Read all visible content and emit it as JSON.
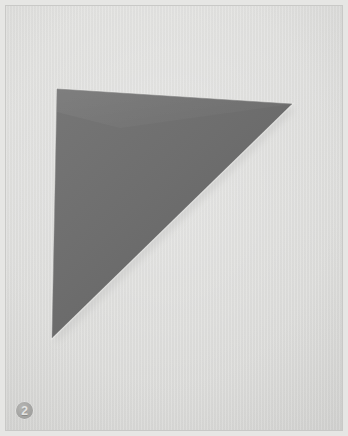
{
  "figure": {
    "number_label": "2",
    "caption": "",
    "badge_icon_name": "circled-number-badge"
  },
  "plate": {
    "width": 348,
    "height": 436,
    "background_color": "#dcdcda",
    "frame_color": "#c9c9c7",
    "margin_color": "#e6e6e4"
  },
  "artwork": {
    "title": "",
    "medium_note": "",
    "shape_name": "triangle",
    "shape_color": "#6e6e6e",
    "shape_color_light": "#787878",
    "shape_color_dark": "#646464",
    "edge_highlight_color": "#e9e9e7",
    "shadow_color": "#c8c8c6",
    "vertices": [
      {
        "name": "top-left",
        "x": 57,
        "y": 89
      },
      {
        "name": "top-right",
        "x": 292,
        "y": 104
      },
      {
        "name": "bottom",
        "x": 52,
        "y": 338
      }
    ]
  }
}
